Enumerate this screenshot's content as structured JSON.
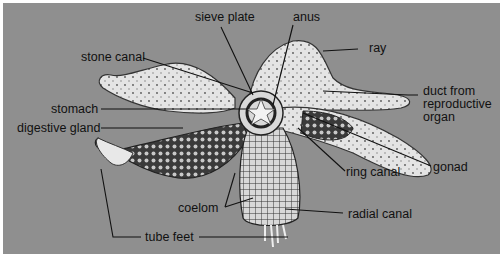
{
  "diagram": {
    "background_color": "#8f8f8f",
    "labels": {
      "sieve_plate": "sieve plate",
      "anus": "anus",
      "ray": "ray",
      "stone_canal": "stone canal",
      "duct_from_reproductive_organ": "duct from reproductive organ",
      "stomach": "stomach",
      "digestive_gland": "digestive gland",
      "gonad": "gonad",
      "ring_canal": "ring canal",
      "coelom": "coelom",
      "radial_canal": "radial canal",
      "tube_feet": "tube feet"
    }
  }
}
